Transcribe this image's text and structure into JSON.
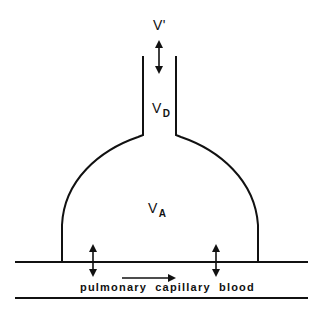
{
  "diagram": {
    "title": "",
    "stroke_color": "#111111",
    "background": "#ffffff",
    "labels": {
      "ventilation": {
        "main": "V",
        "suffix": "'",
        "sub": ""
      },
      "dead_space": {
        "main": "V",
        "sub": "D"
      },
      "alveolar": {
        "main": "V",
        "sub": "A"
      },
      "capillary": "pulmonary capillary blood"
    },
    "elements": {
      "airway_tube": "conducting airway (dead space)",
      "alveolus": "alveolar compartment (dome)",
      "capillary_channel": "pulmonary capillary (two parallel lines)",
      "ventilation_arrow": "bidirectional arrow (tidal ventilation)",
      "exchange_arrows": [
        "bidirectional gas exchange arrow (left)",
        "bidirectional gas exchange arrow (right)"
      ],
      "flow_arrow": "blood flow direction arrow (left to right)"
    }
  }
}
